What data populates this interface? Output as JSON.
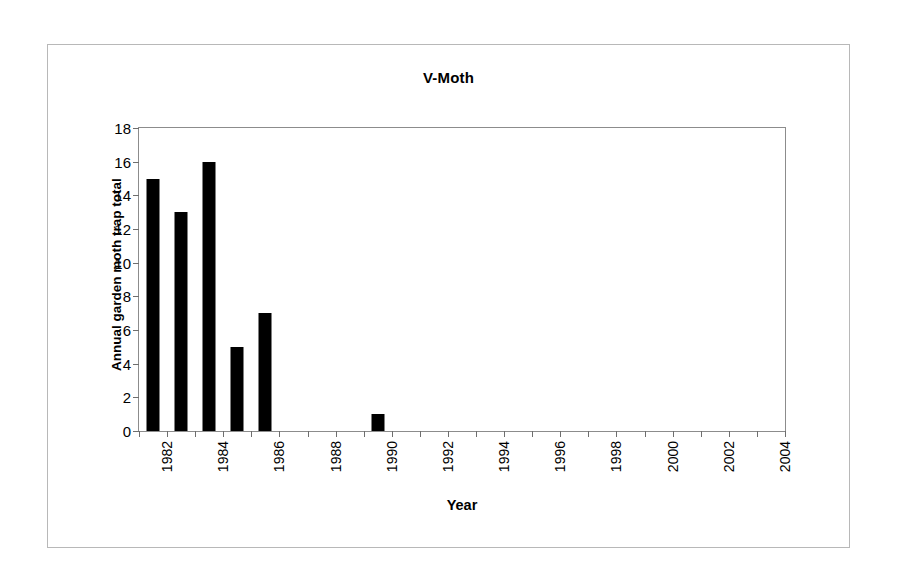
{
  "chart_data": {
    "type": "bar",
    "title": "V-Moth",
    "xlabel": "Year",
    "ylabel": "Annual garden moth trap total",
    "categories": [
      "1982",
      "1983",
      "1984",
      "1985",
      "1986",
      "1987",
      "1988",
      "1989",
      "1990",
      "1991",
      "1992",
      "1993",
      "1994",
      "1995",
      "1996",
      "1997",
      "1998",
      "1999",
      "2000",
      "2001",
      "2002",
      "2003",
      "2004"
    ],
    "values": [
      15,
      13,
      16,
      5,
      7,
      0,
      0,
      0,
      1,
      0,
      0,
      0,
      0,
      0,
      0,
      0,
      0,
      0,
      0,
      0,
      0,
      0,
      0
    ],
    "visible_xticklabels": [
      "1982",
      "1984",
      "1986",
      "1988",
      "1990",
      "1992",
      "1994",
      "1996",
      "1998",
      "2000",
      "2002",
      "2004"
    ],
    "yticks": [
      0,
      2,
      4,
      6,
      8,
      10,
      12,
      14,
      16,
      18
    ],
    "ylim": [
      0,
      18
    ],
    "grid": false,
    "legend": false,
    "bar_color": "#000000",
    "axis_color": "#8c8c8c",
    "frame_color": "#b8b8b8",
    "background": "#ffffff"
  }
}
